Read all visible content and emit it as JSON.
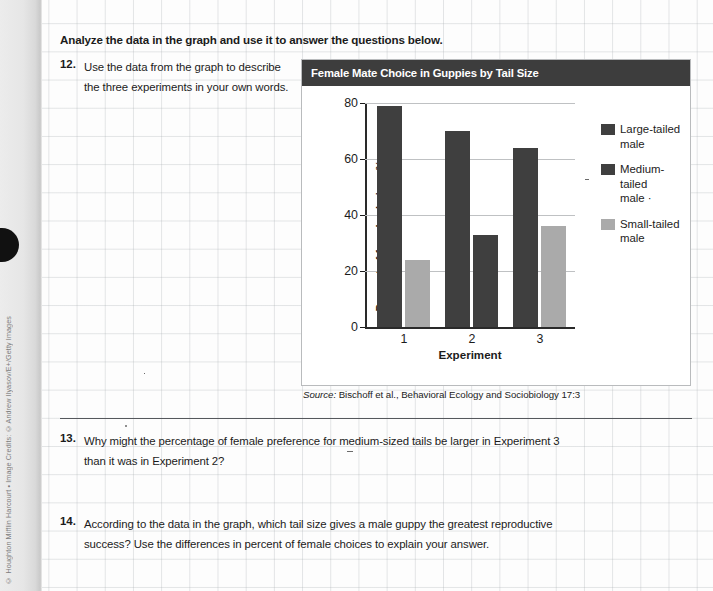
{
  "page": {
    "heading": "Analyze the data in the graph and use it to answer the questions below.",
    "credit": "© Houghton Mifflin Harcourt • Image Credits: ©Andrew Ilyasov/E+/Getty Images"
  },
  "questions": [
    {
      "number": "12.",
      "text": "Use the data from the graph to describe the three experiments in your own words."
    },
    {
      "number": "13.",
      "text": "Why might the percentage of female preference for medium-sized tails be larger in Experiment 3 than it was in Experiment 2?"
    },
    {
      "number": "14.",
      "text": "According to the data in the graph, which tail size gives a male guppy the greatest reproductive success? Use the differences in percent of female choices to explain your answer."
    }
  ],
  "chart_panel": {
    "source_prefix": "Source:",
    "source_text": " Bischoff et al., Behavioral Ecology and Sociobiology 17:3"
  },
  "colors": {
    "title_bar": "#3d3d3d",
    "dark_bar": "#3f3f3f",
    "light_bar": "#aaaaaa",
    "gridline": "#bfc1c3",
    "axis": "#2a2a2a"
  },
  "chart_data": {
    "type": "bar",
    "title": "Female Mate Choice in Guppies by Tail Size",
    "xlabel": "Experiment",
    "ylabel": "Percent of female choices %",
    "categories": [
      "1",
      "2",
      "3"
    ],
    "ylim": [
      0,
      80
    ],
    "yticks": [
      0,
      20,
      40,
      60,
      80
    ],
    "ytick_labels": [
      "0",
      "20",
      "40",
      "60",
      "80"
    ],
    "grid": true,
    "legend_position": "right",
    "series": [
      {
        "name": "Large-tailed male",
        "legend_label": "Large-tailed\nmale",
        "color": "#3f3f3f",
        "values": [
          79,
          70,
          null
        ]
      },
      {
        "name": "Medium-tailed male",
        "legend_label": "Medium-tailed\nmale ·",
        "color": "#3f3f3f",
        "values": [
          null,
          33,
          64
        ]
      },
      {
        "name": "Small-tailed male",
        "legend_label": "Small-tailed\nmale",
        "color": "#aaaaaa",
        "values": [
          24,
          null,
          36
        ]
      }
    ],
    "bars": [
      {
        "group": "1",
        "series": "Large-tailed male",
        "value": 79,
        "color": "#3f3f3f"
      },
      {
        "group": "1",
        "series": "Small-tailed male",
        "value": 24,
        "color": "#aaaaaa"
      },
      {
        "group": "2",
        "series": "Large-tailed male",
        "value": 70,
        "color": "#3f3f3f"
      },
      {
        "group": "2",
        "series": "Medium-tailed male",
        "value": 33,
        "color": "#3f3f3f"
      },
      {
        "group": "3",
        "series": "Medium-tailed male",
        "value": 64,
        "color": "#3f3f3f"
      },
      {
        "group": "3",
        "series": "Small-tailed male",
        "value": 36,
        "color": "#aaaaaa"
      }
    ]
  }
}
